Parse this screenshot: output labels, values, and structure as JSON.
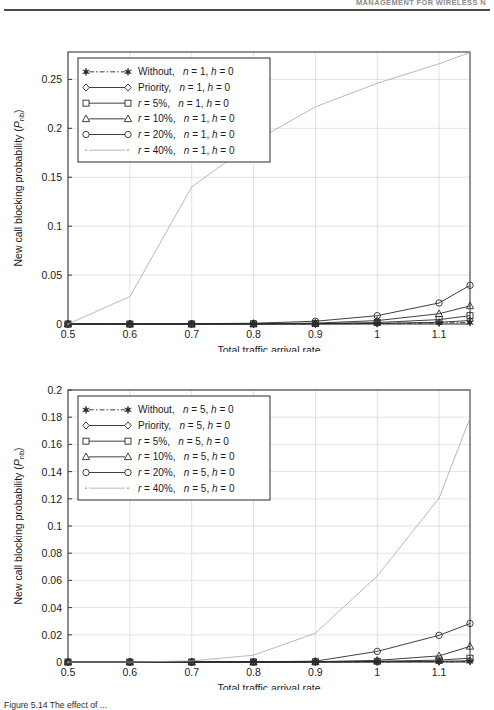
{
  "header": {
    "running_head": "MANAGEMENT FOR WIRELESS N"
  },
  "caption": {
    "text": "Figure 5.14   The effect of ..."
  },
  "charts": [
    {
      "id": "top",
      "chart_data": {
        "type": "line",
        "title": "",
        "xlabel": "Total traffic arrival rate",
        "ylabel": "New call blocking probability (Pnb)",
        "ylabel_main": "New call blocking probability (",
        "ylabel_sym": "P",
        "ylabel_sub": "nb",
        "ylabel_close": ")",
        "xlim": [
          0.5,
          1.15
        ],
        "ylim": [
          0,
          0.278
        ],
        "xticks": [
          0.5,
          0.6,
          0.7,
          0.8,
          0.9,
          1,
          1.1
        ],
        "xticklabels": [
          "0.5",
          "0.6",
          "0.7",
          "0.8",
          "0.9",
          "1",
          "1.1"
        ],
        "yticks": [
          0,
          0.05,
          0.1,
          0.15,
          0.2,
          0.25
        ],
        "yticklabels": [
          "0",
          "0.05",
          "0.1",
          "0.15",
          "0.2",
          "0.25"
        ],
        "grid": true,
        "legend_position": "upper left",
        "x": [
          0.5,
          0.6,
          0.7,
          0.8,
          0.9,
          1.0,
          1.1,
          1.15
        ],
        "series": [
          {
            "name": "Without, n = 1, h = 0",
            "label_pre": "Without,",
            "label_n": "n",
            "label_neq": "= 1,",
            "label_h": "h",
            "label_heq": "= 0",
            "marker": "star",
            "dash": "dashdot",
            "values": [
              0.0,
              0.0,
              0.0,
              0.0,
              0.0002,
              0.0005,
              0.001,
              0.0015
            ]
          },
          {
            "name": "Priority, n = 1, h = 0",
            "label_pre": "Priority,",
            "label_n": "n",
            "label_neq": "= 1,",
            "label_h": "h",
            "label_heq": "= 0",
            "marker": "diamond",
            "dash": "solid",
            "values": [
              0.0,
              0.0,
              0.0,
              0.0,
              0.0002,
              0.0006,
              0.0018,
              0.0035
            ]
          },
          {
            "name": "r = 5%, n = 1, h = 0",
            "label_pre": "r",
            "label_r": "= 5%,",
            "label_n": "n",
            "label_neq": "= 1,",
            "label_h": "h",
            "label_heq": "= 0",
            "marker": "square",
            "dash": "solid",
            "values": [
              0.0,
              0.0,
              0.0,
              0.0001,
              0.0004,
              0.0015,
              0.0045,
              0.0085
            ]
          },
          {
            "name": "r = 10%, n = 1, h = 0",
            "label_pre": "r",
            "label_r": "= 10%,",
            "label_n": "n",
            "label_neq": "= 1,",
            "label_h": "h",
            "label_heq": "= 0",
            "marker": "triangle",
            "dash": "solid",
            "values": [
              0.0,
              0.0,
              0.0,
              0.0002,
              0.0009,
              0.0035,
              0.0105,
              0.0185
            ]
          },
          {
            "name": "r = 20%, n = 1, h = 0",
            "label_pre": "r",
            "label_r": "= 20%,",
            "label_n": "n",
            "label_neq": "= 1,",
            "label_h": "h",
            "label_heq": "= 0",
            "marker": "circle",
            "dash": "solid",
            "values": [
              0.0,
              0.0,
              0.0002,
              0.0008,
              0.0028,
              0.0085,
              0.0215,
              0.0395
            ]
          },
          {
            "name": "r = 40%, n = 1, h = 0",
            "label_pre": "r",
            "label_r": "= 40%,",
            "label_n": "n",
            "label_neq": "= 1,",
            "label_h": "h",
            "label_heq": "= 0",
            "marker": "dot",
            "dash": "solid-light",
            "values": [
              0.0,
              0.028,
              0.14,
              0.186,
              0.222,
              0.246,
              0.266,
              0.2775
            ]
          }
        ]
      }
    },
    {
      "id": "bottom",
      "chart_data": {
        "type": "line",
        "title": "",
        "xlabel": "Total traffic arrival rate",
        "ylabel": "New call blocking probability (Pnb)",
        "ylabel_main": "New call blocking probability (",
        "ylabel_sym": "P",
        "ylabel_sub": "nb",
        "ylabel_close": ")",
        "xlim": [
          0.5,
          1.15
        ],
        "ylim": [
          0,
          0.2
        ],
        "xticks": [
          0.5,
          0.6,
          0.7,
          0.8,
          0.9,
          1,
          1.1
        ],
        "xticklabels": [
          "0.5",
          "0.6",
          "0.7",
          "0.8",
          "0.9",
          "1",
          "1.1"
        ],
        "yticks": [
          0,
          0.02,
          0.04,
          0.06,
          0.08,
          0.1,
          0.12,
          0.14,
          0.16,
          0.18,
          0.2
        ],
        "yticklabels": [
          "0",
          "0.02",
          "0.04",
          "0.06",
          "0.08",
          "0.1",
          "0.12",
          "0.14",
          "0.16",
          "0.18",
          "0.2"
        ],
        "grid": true,
        "legend_position": "upper left",
        "x": [
          0.5,
          0.6,
          0.7,
          0.8,
          0.9,
          1.0,
          1.1,
          1.15
        ],
        "series": [
          {
            "name": "Without, n = 5, h = 0",
            "label_pre": "Without,",
            "label_n": "n",
            "label_neq": "= 5,",
            "label_h": "h",
            "label_heq": "= 0",
            "marker": "star",
            "dash": "dashdot",
            "values": [
              0.0,
              0.0,
              0.0,
              0.0,
              0.0,
              0.0001,
              0.0002,
              0.0004
            ]
          },
          {
            "name": "Priority, n = 5, h = 0",
            "label_pre": "Priority,",
            "label_n": "n",
            "label_neq": "= 5,",
            "label_h": "h",
            "label_heq": "= 0",
            "marker": "diamond",
            "dash": "solid",
            "values": [
              0.0,
              0.0,
              0.0,
              0.0,
              0.0,
              0.0002,
              0.0005,
              0.0009
            ]
          },
          {
            "name": "r = 5%, n = 5, h = 0",
            "label_pre": "r",
            "label_r": "= 5%,",
            "label_n": "n",
            "label_neq": "= 5,",
            "label_h": "h",
            "label_heq": "= 0",
            "marker": "square",
            "dash": "solid",
            "values": [
              0.0,
              0.0,
              0.0,
              0.0,
              0.0001,
              0.0005,
              0.0014,
              0.0028
            ]
          },
          {
            "name": "r = 10%, n = 5, h = 0",
            "label_pre": "r",
            "label_r": "= 10%,",
            "label_n": "n",
            "label_neq": "= 5,",
            "label_h": "h",
            "label_heq": "= 0",
            "marker": "triangle",
            "dash": "solid",
            "values": [
              0.0,
              0.0,
              0.0,
              0.0,
              0.0002,
              0.0012,
              0.0045,
              0.0115
            ]
          },
          {
            "name": "r = 20%, n = 5, h = 0",
            "label_pre": "r",
            "label_r": "= 20%,",
            "label_n": "n",
            "label_neq": "= 5,",
            "label_h": "h",
            "label_heq": "= 0",
            "marker": "circle",
            "dash": "solid",
            "values": [
              0.0,
              0.0,
              0.0,
              0.0001,
              0.0006,
              0.0078,
              0.0196,
              0.0283
            ]
          },
          {
            "name": "r = 40%, n = 5, h = 0",
            "label_pre": "r",
            "label_r": "= 40%,",
            "label_n": "n",
            "label_neq": "= 5,",
            "label_h": "h",
            "label_heq": "= 0",
            "marker": "dot",
            "dash": "solid-light",
            "values": [
              0.0,
              0.0,
              0.0008,
              0.005,
              0.0212,
              0.0632,
              0.1205,
              0.1795
            ]
          }
        ]
      }
    }
  ]
}
